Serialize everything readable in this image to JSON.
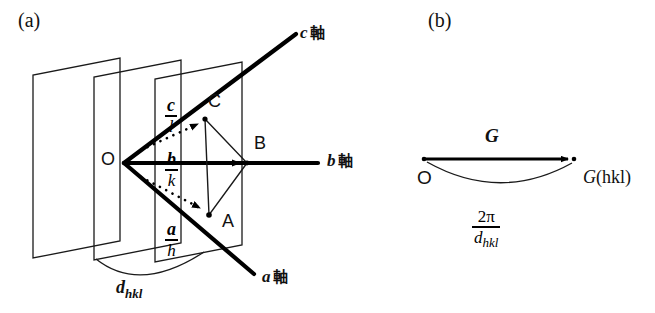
{
  "figure": {
    "panels": [
      {
        "id": "a",
        "label": "(a)"
      },
      {
        "id": "b",
        "label": "(b)"
      }
    ]
  },
  "panel_a": {
    "origin_label": "O",
    "intercept_points": [
      {
        "name": "C",
        "label": "C"
      },
      {
        "name": "B",
        "label": "B"
      },
      {
        "name": "A",
        "label": "A"
      }
    ],
    "axes": [
      {
        "name": "c-axis",
        "vector": "c",
        "suffix": "軸"
      },
      {
        "name": "b-axis",
        "vector": "b",
        "suffix": "軸"
      },
      {
        "name": "a-axis",
        "vector": "a",
        "suffix": "軸"
      }
    ],
    "intercept_vectors": [
      {
        "name": "c-over-l",
        "numerator": "c",
        "denominator": "l"
      },
      {
        "name": "b-over-k",
        "numerator": "b",
        "denominator": "k"
      },
      {
        "name": "a-over-h",
        "numerator": "a",
        "denominator": "h"
      }
    ],
    "spacing": {
      "symbol": "d",
      "subscript": "hkl"
    },
    "plane_count": 3
  },
  "panel_b": {
    "origin_label": "O",
    "vector_label": "G",
    "endpoint_label": "G",
    "endpoint_index": "(hkl)",
    "magnitude": {
      "numerator": "2π",
      "den_symbol": "d",
      "den_subscript": "hkl"
    }
  },
  "colors": {
    "ink": "#000000",
    "background": "#ffffff"
  }
}
